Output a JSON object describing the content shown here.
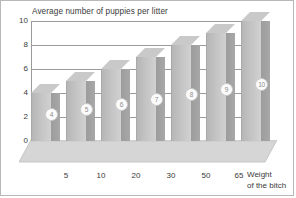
{
  "chart_data": {
    "type": "bar",
    "title": "Average number of puppies per litter",
    "xlabel": "Weight of the bitch",
    "ylabel": "",
    "categories": [
      "",
      "5",
      "10",
      "20",
      "30",
      "50",
      "65"
    ],
    "values": [
      4,
      5,
      6,
      7,
      8,
      9,
      10
    ],
    "point_labels": [
      "4",
      "5",
      "6",
      "7",
      "8",
      "9",
      "10"
    ],
    "ylim": [
      0,
      10
    ],
    "yticks": [
      0,
      2,
      4,
      6,
      8,
      10
    ],
    "grid": true,
    "legend": "none",
    "style": "3d-bar"
  },
  "axis": {
    "xlabel_line1": "Weight",
    "xlabel_line2": "of the bitch"
  },
  "colors": {
    "bar_front": "#c4c4c4",
    "bar_side": "#a0a0a0",
    "bar_top": "#c9c9c9",
    "grid": "#9a9a9a",
    "text": "#3a3a3a",
    "background": "#ffffff",
    "border": "#b8b8b8"
  }
}
